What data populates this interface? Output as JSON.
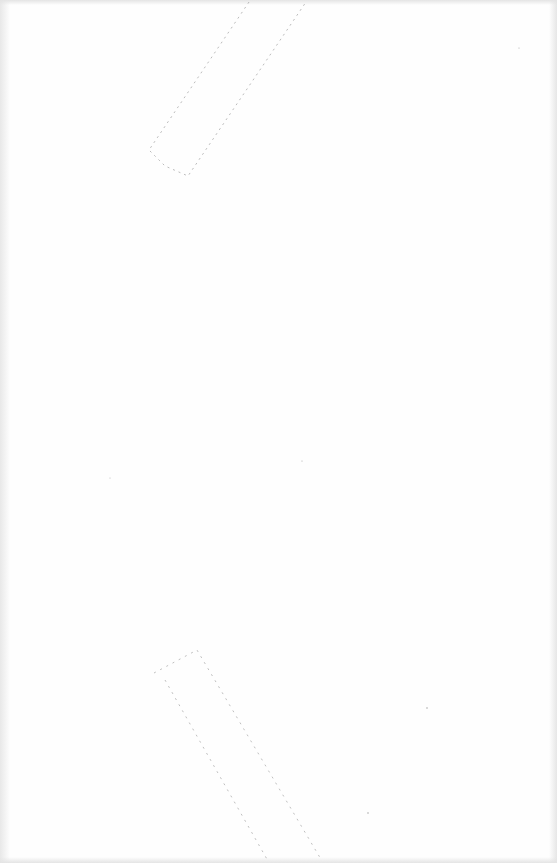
{
  "document": {
    "type": "scanned-blank-page",
    "text": "",
    "marks": [
      {
        "name": "tape-mark-top",
        "description": "faint diagonal outline near top"
      },
      {
        "name": "tape-mark-bottom",
        "description": "faint diagonal outline near bottom"
      }
    ],
    "colors": {
      "paper": "#fefefe",
      "mark": "#9a9a9a"
    }
  }
}
